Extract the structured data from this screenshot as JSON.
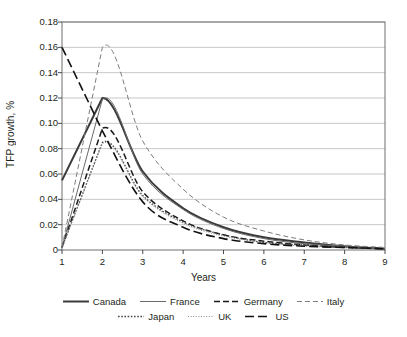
{
  "chart_data": {
    "type": "line",
    "title": "",
    "xlabel": "Years",
    "ylabel": "TFP growth, %",
    "xlim": [
      1,
      9
    ],
    "ylim": [
      0,
      0.18
    ],
    "grid": "horizontal",
    "legend_position": "bottom",
    "x": [
      1,
      2,
      3,
      4,
      5,
      6,
      7,
      8,
      9
    ],
    "xticks": [
      "1",
      "2",
      "3",
      "4",
      "5",
      "6",
      "7",
      "8",
      "9"
    ],
    "yticks": [
      "0",
      "0.02",
      "0.04",
      "0.06",
      "0.08",
      "0.10",
      "0.12",
      "0.14",
      "0.16",
      "0.18"
    ],
    "ytick_values": [
      0,
      0.02,
      0.04,
      0.06,
      0.08,
      0.1,
      0.12,
      0.14,
      0.16,
      0.18
    ],
    "series": [
      {
        "name": "Canada",
        "style": "solid-thick",
        "color": "#3a3a3a",
        "values": [
          0.055,
          0.12,
          0.062,
          0.033,
          0.018,
          0.01,
          0.006,
          0.003,
          0.001
        ]
      },
      {
        "name": "France",
        "style": "solid-thin",
        "color": "#6a6a6a",
        "values": [
          0.002,
          0.119,
          0.06,
          0.032,
          0.017,
          0.009,
          0.005,
          0.003,
          0.001
        ]
      },
      {
        "name": "Germany",
        "style": "dashed",
        "color": "#1a1a1a",
        "values": [
          0.002,
          0.096,
          0.046,
          0.023,
          0.012,
          0.007,
          0.004,
          0.002,
          0.001
        ]
      },
      {
        "name": "Italy",
        "style": "fine-dashed",
        "color": "#7d7d7d",
        "values": [
          0.002,
          0.16,
          0.086,
          0.048,
          0.026,
          0.015,
          0.008,
          0.004,
          0.002
        ]
      },
      {
        "name": "Japan",
        "style": "dotted",
        "color": "#4a4a4a",
        "values": [
          0.002,
          0.085,
          0.043,
          0.022,
          0.012,
          0.006,
          0.004,
          0.002,
          0.001
        ]
      },
      {
        "name": "UK",
        "style": "fine-dotted",
        "color": "#8a8a8a",
        "values": [
          0.002,
          0.084,
          0.042,
          0.021,
          0.011,
          0.006,
          0.003,
          0.002,
          0.001
        ]
      },
      {
        "name": "US",
        "style": "long-dashed",
        "color": "#111111",
        "values": [
          0.16,
          0.094,
          0.038,
          0.018,
          0.009,
          0.005,
          0.003,
          0.002,
          0.001
        ]
      }
    ]
  },
  "axes": {
    "ylabel": "TFP growth, %",
    "xlabel": "Years"
  },
  "legend": {
    "row1": [
      "Canada",
      "France",
      "Germany",
      "Italy"
    ],
    "row2": [
      "Japan",
      "UK",
      "US"
    ]
  }
}
